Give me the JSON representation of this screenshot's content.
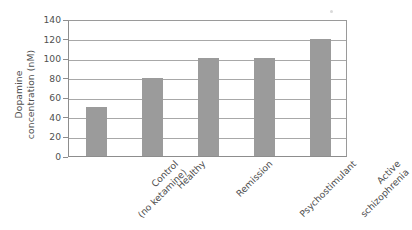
{
  "chart_data": {
    "type": "bar",
    "title": "",
    "xlabel": "",
    "ylabel": "Dopamine concentration (nM)",
    "ylabel_lines": [
      "Dopamine",
      "concentration (nM)"
    ],
    "categories": [
      "Control (no ketamine)",
      "Healthy",
      "Remission",
      "Psychostimulant",
      "Active schizophrenia"
    ],
    "category_lines": [
      [
        "Control",
        "(no ketamine)"
      ],
      [
        "Healthy"
      ],
      [
        "Remission"
      ],
      [
        "Psychostimulant"
      ],
      [
        "Active",
        "schizophrenia"
      ]
    ],
    "values": [
      50,
      80,
      100,
      100,
      120
    ],
    "ylim": [
      0,
      140
    ],
    "yticks": [
      0,
      20,
      40,
      60,
      80,
      100,
      120,
      140
    ],
    "ytick_labels": [
      "0",
      "20",
      "40",
      "60",
      "80",
      "100",
      "120",
      "140"
    ],
    "grid": true,
    "grid_axis": "y",
    "legend": "none",
    "bar_color": "#9b9b9b",
    "grid_color": "#a8a8a8",
    "axis_color": "#8d8d8d",
    "text_color": "#4f4f4f",
    "background_color": "#ffffff"
  }
}
